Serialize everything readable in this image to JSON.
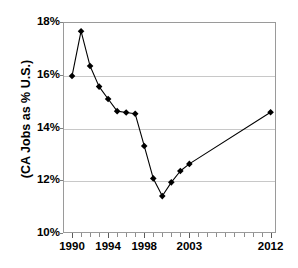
{
  "chart_data": {
    "type": "line",
    "title": "",
    "xlabel": "",
    "ylabel": "(CA Jobs as % U.S.)",
    "xlim": [
      1989.0,
      2012.6
    ],
    "ylim": [
      10,
      18
    ],
    "ytick_values": [
      18,
      16,
      14,
      12,
      10
    ],
    "ytick_labels": [
      "18%",
      "16%",
      "14%",
      "12%",
      "10%"
    ],
    "xtick_labels": [
      "1990",
      "1994",
      "1998",
      "2003",
      "2012"
    ],
    "xtick_label_values": [
      1990,
      1994,
      1998,
      2003,
      2012
    ],
    "xtick_minor_values": [
      1990,
      1991,
      1992,
      1993,
      1994,
      1995,
      1996,
      1997,
      1998,
      1999,
      2000,
      2001,
      2002,
      2003,
      2004,
      2005,
      2006,
      2007,
      2008,
      2009,
      2010,
      2011,
      2012
    ],
    "grid": "horizontal",
    "legend": "none",
    "marker": "diamond",
    "marker_color": "#000000",
    "line_color": "#000000",
    "grid_color": "#c8c8c8",
    "frame_color": "#9a9a9a",
    "x": [
      1990,
      1991,
      1992,
      1993,
      1994,
      1995,
      1996,
      1997,
      1998,
      1999,
      2000,
      2001,
      2002,
      2003,
      2012
    ],
    "values": [
      15.95,
      17.65,
      16.33,
      15.55,
      15.08,
      14.62,
      14.57,
      14.52,
      13.3,
      12.07,
      11.4,
      11.92,
      12.35,
      12.62,
      14.58
    ],
    "series": [
      {
        "name": "CA Jobs as % U.S.",
        "x": [
          1990,
          1991,
          1992,
          1993,
          1994,
          1995,
          1996,
          1997,
          1998,
          1999,
          2000,
          2001,
          2002,
          2003,
          2012
        ],
        "values": [
          15.95,
          17.65,
          16.33,
          15.55,
          15.08,
          14.62,
          14.57,
          14.52,
          13.3,
          12.07,
          11.4,
          11.92,
          12.35,
          12.62,
          14.58
        ]
      }
    ]
  },
  "axis": {
    "y_title": "(CA Jobs as % U.S.)"
  }
}
